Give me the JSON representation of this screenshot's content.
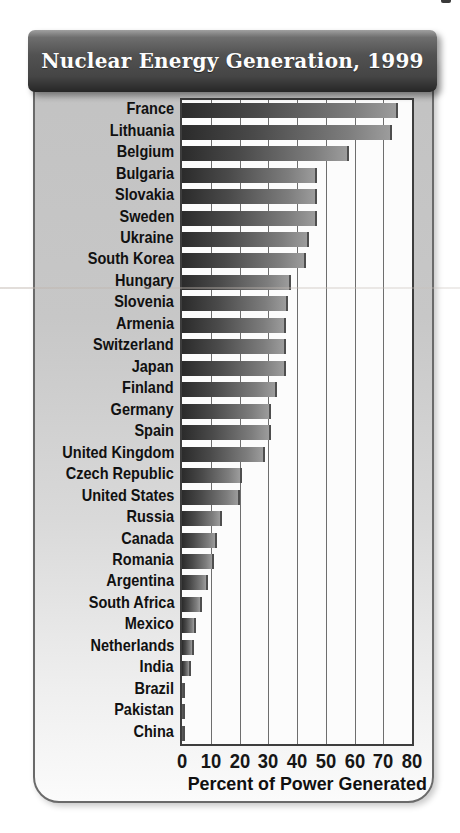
{
  "title": "Nuclear Energy Generation, 1999",
  "chart_data": {
    "type": "bar",
    "orientation": "horizontal",
    "title": "Nuclear Energy Generation, 1999",
    "xlabel": "Percent of Power Generated",
    "xlim": [
      0,
      80
    ],
    "xticks": [
      0,
      10,
      20,
      30,
      40,
      50,
      60,
      70,
      80
    ],
    "grid": true,
    "categories": [
      "France",
      "Lithuania",
      "Belgium",
      "Bulgaria",
      "Slovakia",
      "Sweden",
      "Ukraine",
      "South Korea",
      "Hungary",
      "Slovenia",
      "Armenia",
      "Switzerland",
      "Japan",
      "Finland",
      "Germany",
      "Spain",
      "United Kingdom",
      "Czech Republic",
      "United States",
      "Russia",
      "Canada",
      "Romania",
      "Argentina",
      "South Africa",
      "Mexico",
      "Netherlands",
      "India",
      "Brazil",
      "Pakistan",
      "China"
    ],
    "values": [
      75,
      73,
      58,
      47,
      47,
      47,
      44,
      43,
      38,
      37,
      36,
      36,
      36,
      33,
      31,
      31,
      29,
      21,
      20,
      14,
      12,
      11,
      9,
      7,
      5,
      4,
      3,
      1,
      1,
      1
    ]
  },
  "colors": {
    "header_bg": "#4a4a4a",
    "header_text": "#fdfdfd",
    "card_bg_top": "#c2c2c2",
    "card_bg_bottom": "#fbfbfb",
    "plot_bg": "#fcfcfc",
    "bar_dark": "#2b2b2b",
    "bar_light": "#9c9c9c",
    "gridline": "#6e6e6e"
  }
}
